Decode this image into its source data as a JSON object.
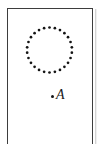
{
  "figure": {
    "background_color": "#ffffff",
    "frame": {
      "name": "figure-border",
      "stroke_color": "#3d3d3d",
      "stroke_width": 1.4,
      "x": 7,
      "y": 8,
      "width": 86,
      "height": 136,
      "bottom_open": true
    },
    "shapes": [
      {
        "name": "dotted-circle",
        "type": "beaded-circle",
        "center_x": 49.5,
        "center_y": 50.0,
        "radius": 22.5,
        "bead_count": 26,
        "bead_radius": 1.35,
        "bead_color": "#141414",
        "fill": "none"
      },
      {
        "name": "point-a-marker",
        "type": "point",
        "center_x": 52.5,
        "center_y": 96.5,
        "radius": 1.5,
        "color": "#141414"
      }
    ],
    "labels": [
      {
        "name": "point-label-a",
        "text": "A",
        "style": "italic",
        "x": 56,
        "y": 88,
        "color": "#1a1a1a"
      }
    ]
  }
}
